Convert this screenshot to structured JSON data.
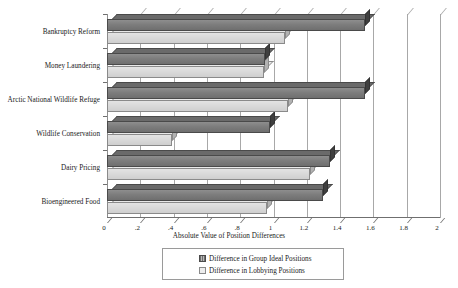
{
  "chart_data": {
    "type": "bar",
    "orientation": "horizontal",
    "title": "",
    "xlabel": "Absolute Value of Position Differences",
    "ylabel": "",
    "xlim": [
      0,
      2
    ],
    "xticks": [
      "0",
      ".2",
      ".4",
      ".6",
      ".8",
      "1",
      "1.2",
      "1.4",
      "1.6",
      "1.8",
      "2"
    ],
    "xtick_values": [
      0,
      0.2,
      0.4,
      0.6,
      0.8,
      1,
      1.2,
      1.4,
      1.6,
      1.8,
      2
    ],
    "grid": true,
    "legend_position": "bottom",
    "categories": [
      "Bankruptcy Reform",
      "Money Laundering",
      "Arctic National Wildlife Refuge",
      "Wildlife Conservation",
      "Dairy Pricing",
      "Bioengineered Food"
    ],
    "series": [
      {
        "name": "Difference in Group Ideal Positions",
        "color": "#7d7d7d",
        "values": [
          1.55,
          0.95,
          1.55,
          0.98,
          1.34,
          1.3
        ]
      },
      {
        "name": "Difference in Lobbying Positions",
        "color": "#d9d9d9",
        "values": [
          1.07,
          0.94,
          1.09,
          0.39,
          1.22,
          0.96
        ]
      }
    ]
  },
  "axis": {
    "x_title": "Absolute Value of Position Differences"
  },
  "legend": {
    "items": [
      {
        "label": "Difference in Group Ideal Positions",
        "swatch": "dark-swatch-icon"
      },
      {
        "label": "Difference in Lobbying Positions",
        "swatch": "light-swatch-icon"
      }
    ]
  }
}
